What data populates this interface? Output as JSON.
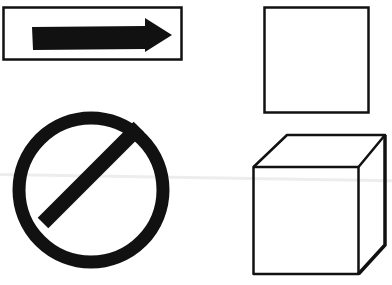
{
  "diagram": {
    "background": "#ffffff",
    "stroke_color": "#111111",
    "shapes": [
      {
        "id": "arrow-sign",
        "type": "rectangle-with-arrow",
        "description": "Rectangular sign with a solid black right-pointing arrow"
      },
      {
        "id": "square",
        "type": "square",
        "description": "Outlined square"
      },
      {
        "id": "prohibition-sign",
        "type": "circle-with-slash",
        "description": "Thick black circle with a diagonal bar"
      },
      {
        "id": "cube",
        "type": "cube",
        "description": "Outlined 3D cube in perspective"
      }
    ]
  }
}
